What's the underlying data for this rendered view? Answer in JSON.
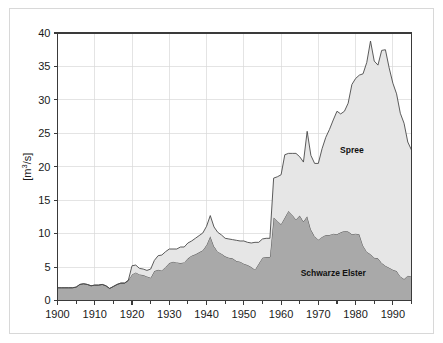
{
  "figure": {
    "name": "discharge-area-chart",
    "background_color": "#ffffff",
    "frame_color": "#d8d8d8"
  },
  "chart_data": {
    "type": "area",
    "stacked": true,
    "title": "",
    "subtitle": "",
    "xlabel": "",
    "ylabel": "[m³/s]",
    "ylabel_parts": {
      "prefix": "[m",
      "sup": "3",
      "suffix": "/s]"
    },
    "xlim": [
      1900,
      1995
    ],
    "ylim": [
      0,
      40
    ],
    "ytick_values": [
      0,
      5,
      10,
      15,
      20,
      25,
      30,
      35,
      40
    ],
    "ytick_labels": [
      "0",
      "5",
      "10",
      "15",
      "20",
      "25",
      "30",
      "35",
      "40"
    ],
    "xtick_values": [
      1900,
      1910,
      1920,
      1930,
      1940,
      1950,
      1960,
      1970,
      1980,
      1990
    ],
    "xtick_labels": [
      "1900",
      "1910",
      "1920",
      "1930",
      "1940",
      "1950",
      "1960",
      "1970",
      "1980",
      "1990"
    ],
    "xminor_step": 5,
    "grid": "both-light",
    "legend_position": "inline-annotations",
    "colors": {
      "schwarze_elster_fill": "#a9a9a9",
      "spree_fill": "#e6e6e6",
      "outline": "#4a4a4a",
      "grid": "#d9d9d9",
      "axis": "#3a3a3a",
      "text": "#1a1a1a"
    },
    "x": [
      1900,
      1901,
      1902,
      1903,
      1904,
      1905,
      1906,
      1907,
      1908,
      1909,
      1910,
      1911,
      1912,
      1913,
      1914,
      1915,
      1916,
      1917,
      1918,
      1919,
      1920,
      1921,
      1922,
      1923,
      1924,
      1925,
      1926,
      1927,
      1928,
      1929,
      1930,
      1931,
      1932,
      1933,
      1934,
      1935,
      1936,
      1937,
      1938,
      1939,
      1940,
      1941,
      1942,
      1943,
      1944,
      1945,
      1946,
      1947,
      1948,
      1949,
      1950,
      1951,
      1952,
      1953,
      1954,
      1955,
      1956,
      1957,
      1958,
      1959,
      1960,
      1961,
      1962,
      1963,
      1964,
      1965,
      1966,
      1967,
      1968,
      1969,
      1970,
      1971,
      1972,
      1973,
      1974,
      1975,
      1976,
      1977,
      1978,
      1979,
      1980,
      1981,
      1982,
      1983,
      1984,
      1985,
      1986,
      1987,
      1988,
      1989,
      1990,
      1991,
      1992,
      1993,
      1994,
      1995
    ],
    "series": [
      {
        "name": "Schwarze Elster",
        "label": "Schwarze Elster",
        "fill": "#a9a9a9",
        "values": [
          1.9,
          1.9,
          1.9,
          1.9,
          1.9,
          2.0,
          2.4,
          2.5,
          2.4,
          2.2,
          2.3,
          2.3,
          2.4,
          2.2,
          1.8,
          2.1,
          2.4,
          2.6,
          2.6,
          3.0,
          3.9,
          4.2,
          3.9,
          3.8,
          3.6,
          3.4,
          4.4,
          4.6,
          4.5,
          5.0,
          5.6,
          5.8,
          5.7,
          5.6,
          5.7,
          6.3,
          6.7,
          6.9,
          7.2,
          7.5,
          8.3,
          9.6,
          8.1,
          7.3,
          7.0,
          6.6,
          6.4,
          6.3,
          5.9,
          5.8,
          5.5,
          5.3,
          5.0,
          4.6,
          5.5,
          6.4,
          6.5,
          6.5,
          12.4,
          11.9,
          11.4,
          12.4,
          13.4,
          12.8,
          12.1,
          12.7,
          11.8,
          12.6,
          10.6,
          9.6,
          9.1,
          9.5,
          9.8,
          9.8,
          10.0,
          9.9,
          10.2,
          10.4,
          10.3,
          9.9,
          10.0,
          9.9,
          8.2,
          7.3,
          6.9,
          6.4,
          6.3,
          5.6,
          5.2,
          4.9,
          4.6,
          4.4,
          3.6,
          3.2,
          3.7,
          3.6
        ]
      },
      {
        "name": "Spree",
        "label": "Spree",
        "fill": "#e6e6e6",
        "values": [
          0.0,
          0.0,
          0.0,
          0.0,
          0.0,
          0.0,
          0.0,
          0.0,
          0.0,
          0.0,
          0.0,
          0.0,
          0.0,
          0.0,
          0.0,
          0.0,
          0.0,
          0.0,
          0.0,
          0.0,
          1.3,
          1.1,
          0.9,
          0.9,
          0.9,
          1.3,
          1.6,
          2.1,
          2.3,
          2.3,
          2.1,
          1.9,
          2.0,
          2.4,
          2.3,
          2.3,
          2.2,
          2.4,
          2.5,
          2.6,
          2.8,
          3.1,
          2.9,
          2.9,
          2.8,
          2.7,
          2.8,
          2.8,
          3.1,
          3.1,
          3.4,
          3.4,
          3.6,
          4.1,
          3.2,
          2.8,
          2.8,
          2.8,
          5.9,
          6.6,
          7.4,
          9.4,
          8.6,
          9.2,
          9.9,
          8.8,
          8.9,
          12.7,
          11.1,
          10.9,
          11.4,
          13.2,
          14.6,
          15.8,
          17.0,
          18.4,
          17.7,
          17.9,
          19.2,
          22.4,
          23.2,
          23.8,
          25.7,
          28.3,
          31.9,
          29.4,
          28.9,
          31.8,
          32.3,
          29.9,
          27.9,
          26.5,
          24.4,
          23.3,
          20.0,
          18.9
        ]
      }
    ],
    "annotations": [
      {
        "text": "Spree",
        "x": 1979,
        "y": 22.0,
        "name": "spree-label"
      },
      {
        "text": "Schwarze Elster",
        "x": 1974,
        "y": 3.7,
        "name": "schwarze-elster-label"
      }
    ]
  }
}
